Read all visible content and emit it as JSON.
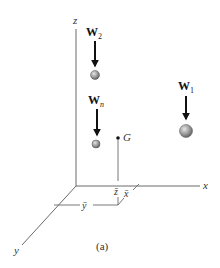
{
  "figure": {
    "caption": "(a)",
    "axes": {
      "x_label": "x",
      "y_label": "y",
      "z_label": "z"
    },
    "weights": [
      {
        "id": "W2",
        "symbol": "W",
        "subscript": "2"
      },
      {
        "id": "Wn",
        "symbol": "W",
        "subscript": "n"
      },
      {
        "id": "W1",
        "symbol": "W",
        "subscript": "1"
      }
    ],
    "center_of_gravity": {
      "label": "G"
    },
    "dimensions": {
      "x_bar": "x̄",
      "y_bar": "ȳ",
      "z_bar": "z̄"
    },
    "colors": {
      "sphere_fill": "#9a9a9a",
      "arrow": "#111111",
      "axis": "#6a6a6a"
    }
  }
}
